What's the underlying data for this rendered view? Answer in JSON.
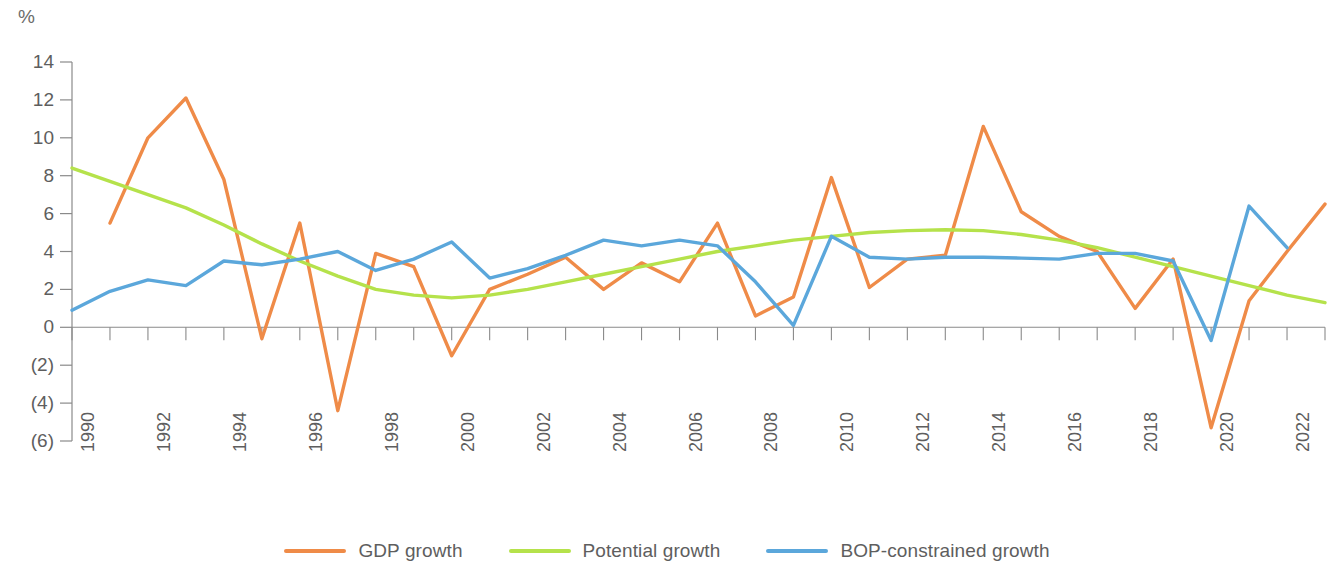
{
  "chart_data": {
    "type": "line",
    "title": "",
    "subtitle": "",
    "xlabel": "",
    "ylabel": "%",
    "unit_label": "%",
    "grid": false,
    "legend_position": "bottom-center",
    "ylim": [
      -6,
      14
    ],
    "y_ticks": [
      14,
      12,
      10,
      8,
      6,
      4,
      2,
      0,
      -2,
      -4,
      -6
    ],
    "y_tick_labels": [
      "14",
      "12",
      "10",
      "8",
      "6",
      "4",
      "2",
      "0",
      "(2)",
      "(4)",
      "(6)"
    ],
    "xlim": [
      1990,
      2023
    ],
    "x_tick_labels": [
      "1990",
      "1992",
      "1994",
      "1996",
      "1998",
      "2000",
      "2002",
      "2004",
      "2006",
      "2008",
      "2010",
      "2012",
      "2014",
      "2016",
      "2018",
      "2020",
      "2022"
    ],
    "x": [
      1990,
      1991,
      1992,
      1993,
      1994,
      1995,
      1996,
      1997,
      1998,
      1999,
      2000,
      2001,
      2002,
      2003,
      2004,
      2005,
      2006,
      2007,
      2008,
      2009,
      2010,
      2011,
      2012,
      2013,
      2014,
      2015,
      2016,
      2017,
      2018,
      2019,
      2020,
      2021,
      2022,
      2023
    ],
    "series": [
      {
        "name": "GDP growth",
        "color": "#ef8b48",
        "x": [
          1991,
          1992,
          1993,
          1994,
          1995,
          1996,
          1997,
          1998,
          1999,
          2000,
          2001,
          2002,
          2003,
          2004,
          2005,
          2006,
          2007,
          2008,
          2009,
          2010,
          2011,
          2012,
          2013,
          2014,
          2015,
          2016,
          2017,
          2018,
          2019,
          2020,
          2021,
          2022,
          2023
        ],
        "values": [
          5.5,
          10.0,
          12.1,
          7.8,
          -0.6,
          5.5,
          -4.4,
          3.9,
          3.2,
          -1.5,
          2.0,
          2.8,
          3.7,
          2.0,
          3.4,
          2.4,
          5.5,
          0.6,
          1.6,
          7.9,
          2.1,
          3.6,
          3.8,
          10.6,
          6.1,
          4.8,
          4.0,
          1.0,
          3.6,
          -5.3,
          1.4,
          4.0,
          6.5
        ]
      },
      {
        "name": "Potential growth",
        "color": "#b5e24b",
        "x": [
          1990,
          1991,
          1992,
          1993,
          1994,
          1995,
          1996,
          1997,
          1998,
          1999,
          2000,
          2001,
          2002,
          2003,
          2004,
          2005,
          2006,
          2007,
          2008,
          2009,
          2010,
          2011,
          2012,
          2013,
          2014,
          2015,
          2016,
          2017,
          2018,
          2019,
          2020,
          2021,
          2022,
          2023
        ],
        "values": [
          8.4,
          7.7,
          7.0,
          6.3,
          5.4,
          4.4,
          3.5,
          2.7,
          2.0,
          1.7,
          1.55,
          1.7,
          2.0,
          2.4,
          2.8,
          3.2,
          3.6,
          4.0,
          4.3,
          4.6,
          4.8,
          5.0,
          5.1,
          5.15,
          5.1,
          4.9,
          4.6,
          4.2,
          3.7,
          3.2,
          2.7,
          2.2,
          1.7,
          1.3
        ]
      },
      {
        "name": "BOP-constrained growth",
        "color": "#5ba7db",
        "x": [
          1990,
          1991,
          1992,
          1993,
          1994,
          1995,
          1996,
          1997,
          1998,
          1999,
          2000,
          2001,
          2002,
          2003,
          2004,
          2005,
          2006,
          2007,
          2008,
          2009,
          2010,
          2011,
          2012,
          2013,
          2014,
          2015,
          2016,
          2017,
          2018,
          2019,
          2020,
          2021,
          2022
        ],
        "values": [
          0.9,
          1.9,
          2.5,
          2.2,
          3.5,
          3.3,
          3.6,
          4.0,
          3.0,
          3.6,
          4.5,
          2.6,
          3.1,
          3.8,
          4.6,
          4.3,
          4.6,
          4.3,
          2.4,
          0.1,
          4.8,
          3.7,
          3.6,
          3.7,
          3.7,
          3.65,
          3.6,
          3.9,
          3.9,
          3.5,
          -0.7,
          6.4,
          4.2
        ]
      }
    ]
  },
  "legend": {
    "items": [
      {
        "label": "GDP growth",
        "color": "#ef8b48"
      },
      {
        "label": "Potential growth",
        "color": "#b5e24b"
      },
      {
        "label": "BOP-constrained growth",
        "color": "#5ba7db"
      }
    ]
  }
}
